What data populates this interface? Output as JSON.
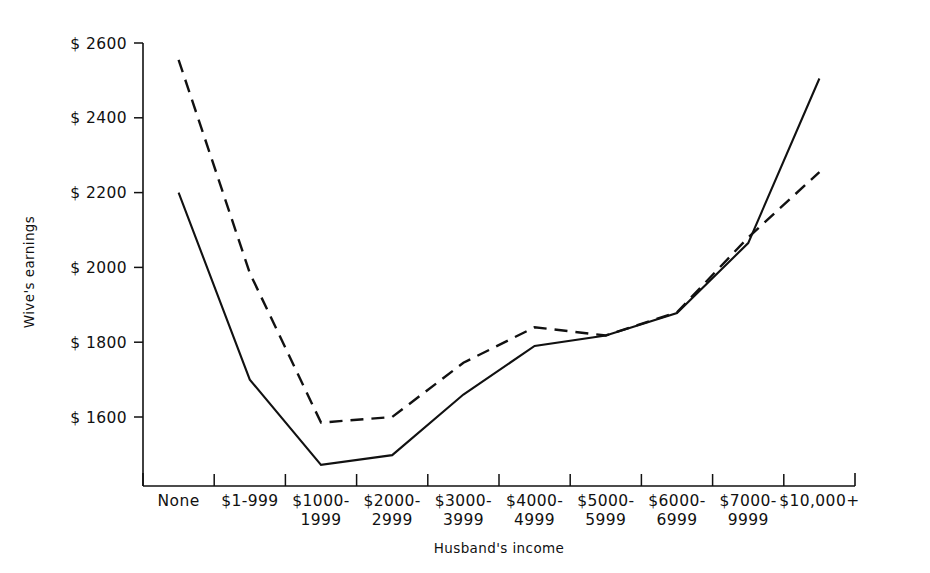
{
  "chart_data": {
    "type": "line",
    "title": "",
    "xlabel": "Husband's income",
    "ylabel": "Wive's earnings",
    "categories": [
      "None",
      "$1-999",
      "$1000-\n1999",
      "$2000-\n2999",
      "$3000-\n3999",
      "$4000-\n4999",
      "$5000-\n5999",
      "$6000-\n6999",
      "$7000-\n9999",
      "$10,000+"
    ],
    "category_lines": [
      [
        "None"
      ],
      [
        "$1-999"
      ],
      [
        "$1000-",
        "1999"
      ],
      [
        "$2000-",
        "2999"
      ],
      [
        "$3000-",
        "3999"
      ],
      [
        "$4000-",
        "4999"
      ],
      [
        "$5000-",
        "5999"
      ],
      [
        "$6000-",
        "6999"
      ],
      [
        "$7000-",
        "9999"
      ],
      [
        "$10,000+"
      ]
    ],
    "ylim": [
      1400,
      2600
    ],
    "yticks": [
      1600,
      1800,
      2000,
      2200,
      2400,
      2600
    ],
    "ytick_labels": [
      "$ 1600",
      "$ 1800",
      "$ 2000",
      "$ 2200",
      "$ 2400",
      "$ 2600"
    ],
    "grid": false,
    "legend": "none",
    "series": [
      {
        "name": "solid",
        "style": "solid",
        "color": "#111111",
        "values": [
          2200,
          1700,
          1472,
          1498,
          1660,
          1790,
          1818,
          1878,
          2065,
          2505
        ]
      },
      {
        "name": "dashed",
        "style": "dashed",
        "color": "#111111",
        "values": [
          2555,
          1985,
          1585,
          1600,
          1745,
          1840,
          1818,
          1880,
          2080,
          2255
        ]
      }
    ]
  }
}
